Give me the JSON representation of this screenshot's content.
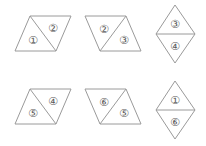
{
  "figure": {
    "background_color": "#ffffff",
    "stroke_color": "#9a9a9a",
    "label_color": "#5a5a5a",
    "rows": 2,
    "columns": 3,
    "shapes": [
      {
        "id": "shape-1",
        "position": "top-left",
        "form": "parallelogram-right-leaning",
        "labels": {
          "left": "①",
          "right": "②"
        },
        "left_label": "①",
        "right_label": "②"
      },
      {
        "id": "shape-2",
        "position": "top-middle",
        "form": "parallelogram-left-leaning",
        "labels": {
          "left": "②",
          "right": "③"
        },
        "left_label": "②",
        "right_label": "③"
      },
      {
        "id": "shape-3",
        "position": "top-right",
        "form": "vertical-rhombus",
        "labels": {
          "top": "③",
          "bottom": "④"
        },
        "top_label": "③",
        "bottom_label": "④"
      },
      {
        "id": "shape-4",
        "position": "bottom-left",
        "form": "parallelogram-right-leaning",
        "labels": {
          "left": "⑤",
          "right": "④"
        },
        "left_label": "⑤",
        "right_label": "④"
      },
      {
        "id": "shape-5",
        "position": "bottom-middle",
        "form": "parallelogram-left-leaning",
        "labels": {
          "left": "⑥",
          "right": "⑤"
        },
        "left_label": "⑥",
        "right_label": "⑤"
      },
      {
        "id": "shape-6",
        "position": "bottom-right",
        "form": "vertical-rhombus",
        "labels": {
          "top": "①",
          "bottom": "⑥"
        },
        "top_label": "①",
        "bottom_label": "⑥"
      }
    ]
  }
}
